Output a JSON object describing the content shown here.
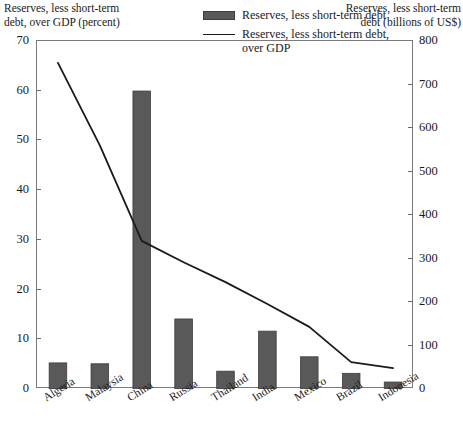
{
  "chart_data": {
    "type": "bar",
    "title": "",
    "categories": [
      "Algeria",
      "Malaysia",
      "China",
      "Russia",
      "Thailand",
      "India",
      "Mexico",
      "Brazil",
      "Indonesia"
    ],
    "series": [
      {
        "name": "Reserves, less short-term debt",
        "type": "bar",
        "axis": "right",
        "unit": "billions of US$",
        "values": [
          60,
          58,
          685,
          161,
          41,
          133,
          74,
          36,
          16
        ]
      },
      {
        "name": "Reserves, less short-term debt, over GDP",
        "type": "line",
        "axis": "left",
        "unit": "percent",
        "values": [
          65.6,
          49.0,
          29.8,
          25.5,
          21.5,
          17.1,
          12.5,
          5.4,
          4.2
        ]
      }
    ],
    "xlabel": "",
    "ylabel_left": "Reserves, less short-term\ndebt, over GDP (percent)",
    "ylabel_right": "Reserves, less short-term\ndebt (billions of US$)",
    "ylim_left": [
      0,
      70
    ],
    "ylim_right": [
      0,
      800
    ],
    "yticks_left": [
      0,
      10,
      20,
      30,
      40,
      50,
      60,
      70
    ],
    "yticks_right": [
      0,
      100,
      200,
      300,
      400,
      500,
      600,
      700,
      800
    ],
    "grid": false,
    "legend_position": "top-right",
    "colors": {
      "bar_fill": "#595959",
      "bar_edge": "#3d3d3d",
      "line": "#1a1a1a",
      "axis": "#7a7a7a",
      "background": "#ffffff"
    }
  },
  "axis_titles": {
    "left": "Reserves, less short-term\ndebt, over GDP (percent)",
    "right": "Reserves, less short-term\ndebt (billions of US$)"
  },
  "legend": {
    "items": [
      {
        "label": "Reserves, less short-term debt",
        "marker": "bar-swatch"
      },
      {
        "label": "Reserves, less short-term debt, over GDP",
        "marker": "line-swatch"
      }
    ]
  },
  "ticks": {
    "left": [
      "70",
      "60",
      "50",
      "40",
      "30",
      "20",
      "10",
      "0"
    ],
    "right": [
      "800",
      "700",
      "600",
      "500",
      "400",
      "300",
      "200",
      "100",
      "0"
    ]
  }
}
